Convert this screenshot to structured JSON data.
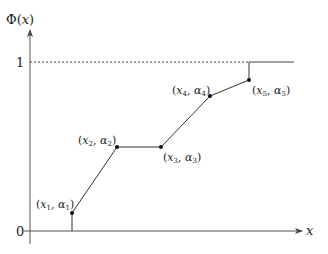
{
  "diagram": {
    "y_axis_label": "Φ(x)",
    "x_axis_label": "x",
    "y_ticks": [
      {
        "label": "1",
        "y": 62
      },
      {
        "label": "0",
        "y": 231
      }
    ],
    "points": [
      {
        "id": "p1",
        "label": "(x1, α1)",
        "x": 72,
        "y": 213
      },
      {
        "id": "p2",
        "label": "(x2, α2)",
        "x": 117,
        "y": 147
      },
      {
        "id": "p3",
        "label": "(x3, α3)",
        "x": 161,
        "y": 147
      },
      {
        "id": "p4",
        "label": "(x4, α4)",
        "x": 210,
        "y": 96
      },
      {
        "id": "p5",
        "label": "(x5, α5)",
        "x": 249,
        "y": 80
      }
    ],
    "colors": {
      "line": "#333333",
      "axis": "#555555",
      "dashed": "#444444"
    }
  }
}
